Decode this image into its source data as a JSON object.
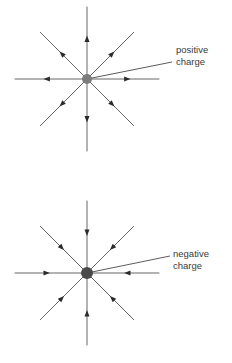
{
  "figure": {
    "background_color": "#ffffff",
    "line_color": "#555555",
    "label_color": "#3a3a3a",
    "diagrams": [
      {
        "id": "positive-charge-field",
        "label_line1": "positive",
        "label_line2": "charge",
        "label_x": 176,
        "label_y": 53,
        "center_x": 87,
        "center_y": 79,
        "charge_sign": "positive",
        "charge_dot_color": "#7d7d7d",
        "charge_dot_radius": 5.0,
        "field_direction": "outward",
        "leader_from_x": 87,
        "leader_from_y": 79,
        "leader_to_x": 172,
        "leader_to_y": 62,
        "field_lines": [
          {
            "angle_deg": 90,
            "length": 72,
            "arrow_at": 0.56
          },
          {
            "angle_deg": 45,
            "length": 66,
            "arrow_at": 0.54
          },
          {
            "angle_deg": 0,
            "length": 72,
            "arrow_at": 0.56
          },
          {
            "angle_deg": -45,
            "length": 66,
            "arrow_at": 0.54
          },
          {
            "angle_deg": -90,
            "length": 72,
            "arrow_at": 0.56
          },
          {
            "angle_deg": 225,
            "length": 66,
            "arrow_at": 0.54
          },
          {
            "angle_deg": 180,
            "length": 72,
            "arrow_at": 0.56
          },
          {
            "angle_deg": 135,
            "length": 66,
            "arrow_at": 0.54
          }
        ]
      },
      {
        "id": "negative-charge-field",
        "label_line1": "negative",
        "label_line2": "charge",
        "label_x": 173,
        "label_y": 257,
        "center_x": 87,
        "center_y": 273,
        "charge_sign": "negative",
        "charge_dot_color": "#4a4a4a",
        "charge_dot_radius": 6.0,
        "field_direction": "inward",
        "leader_from_x": 87,
        "leader_from_y": 273,
        "leader_to_x": 170,
        "leader_to_y": 256,
        "field_lines": [
          {
            "angle_deg": 90,
            "length": 72,
            "arrow_at": 0.56
          },
          {
            "angle_deg": 45,
            "length": 66,
            "arrow_at": 0.54
          },
          {
            "angle_deg": 0,
            "length": 72,
            "arrow_at": 0.56
          },
          {
            "angle_deg": -45,
            "length": 66,
            "arrow_at": 0.54
          },
          {
            "angle_deg": -90,
            "length": 72,
            "arrow_at": 0.56
          },
          {
            "angle_deg": 225,
            "length": 66,
            "arrow_at": 0.54
          },
          {
            "angle_deg": 180,
            "length": 72,
            "arrow_at": 0.56
          },
          {
            "angle_deg": 135,
            "length": 66,
            "arrow_at": 0.54
          }
        ]
      }
    ]
  }
}
